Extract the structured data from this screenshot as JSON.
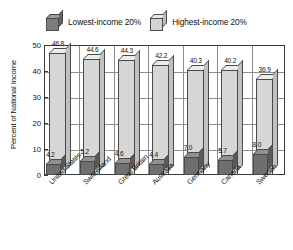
{
  "chart_data": {
    "type": "bar",
    "title": "",
    "xlabel": "",
    "ylabel": "Percent of National Income",
    "ylim": [
      0,
      50
    ],
    "yticks": [
      "0",
      "10",
      "20",
      "30",
      "40",
      "50"
    ],
    "grid": true,
    "legend_position": "top-center",
    "categories": [
      "United States",
      "Switzerland",
      "Great Britain",
      "Australia",
      "Germany",
      "Canada",
      "Sweden"
    ],
    "series": [
      {
        "name": "Lowest-income 20%",
        "swatch": "dark",
        "color": "#6f6f6f",
        "values": [
          4.2,
          5.2,
          4.6,
          4.4,
          7.0,
          5.7,
          8.0
        ],
        "labels": [
          "4.2",
          "5.2",
          "4.6",
          "4.4",
          "7.0",
          "5.7",
          "8.0"
        ]
      },
      {
        "name": "Highest-income 20%",
        "swatch": "light",
        "color": "#d6d6d6",
        "values": [
          46.8,
          44.6,
          44.3,
          42.2,
          40.3,
          40.2,
          36.9
        ],
        "labels": [
          "46.8",
          "44.6",
          "44.3",
          "42.2",
          "40.3",
          "40.2",
          "36.9"
        ]
      }
    ]
  },
  "legend": {
    "entries": [
      {
        "label": "Lowest-income 20%",
        "swatch": "dark"
      },
      {
        "label": "Highest-income 20%",
        "swatch": "light"
      }
    ]
  }
}
